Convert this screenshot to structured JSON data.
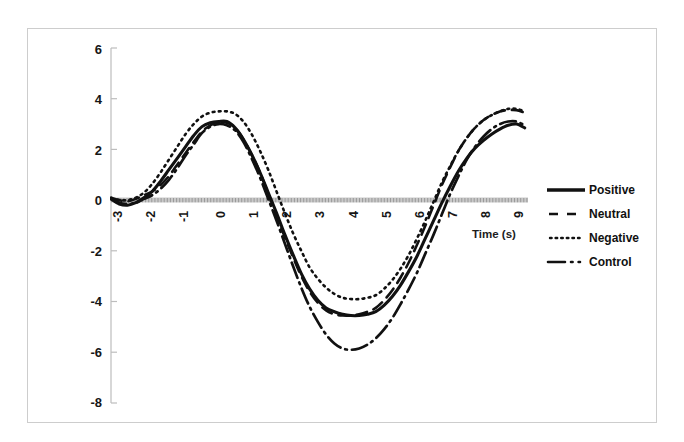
{
  "chart_data": {
    "type": "line",
    "title": "",
    "xlabel": "Time (s)",
    "ylabel": "Change in heart rate (beats/mn)",
    "xlim": [
      -3,
      9.6
    ],
    "ylim": [
      -8,
      6
    ],
    "xticks": [
      "-3",
      "-2",
      "-1",
      "0",
      "1",
      "2",
      "3",
      "4",
      "5",
      "6",
      "7",
      "8",
      "9"
    ],
    "yticks": [
      "6",
      "4",
      "2",
      "0",
      "-2",
      "-4",
      "-6",
      "-8"
    ],
    "grid": false,
    "legend_position": "right",
    "x": [
      -3,
      -2.75,
      -2.5,
      -2.25,
      -2,
      -1.75,
      -1.5,
      -1.25,
      -1,
      -0.75,
      -0.5,
      -0.25,
      0,
      0.25,
      0.5,
      0.75,
      1,
      1.25,
      1.5,
      1.75,
      2,
      2.25,
      2.5,
      2.75,
      3,
      3.25,
      3.5,
      3.75,
      4,
      4.25,
      4.5,
      4.75,
      5,
      5.25,
      5.5,
      5.75,
      6,
      6.25,
      6.5,
      6.75,
      7,
      7.25,
      7.5,
      7.75,
      8,
      8.25,
      8.5,
      8.75,
      9,
      9.25,
      9.5
    ],
    "series": [
      {
        "name": "Positive",
        "style": "solid",
        "color": "#111111",
        "values": [
          0.05,
          -0.15,
          -0.2,
          -0.1,
          0.1,
          0.35,
          0.75,
          1.2,
          1.65,
          2.1,
          2.55,
          2.9,
          3.05,
          3.1,
          3.1,
          2.85,
          2.4,
          1.8,
          1.1,
          0.3,
          -0.5,
          -1.35,
          -2.15,
          -2.9,
          -3.5,
          -3.95,
          -4.25,
          -4.4,
          -4.5,
          -4.55,
          -4.55,
          -4.5,
          -4.4,
          -4.15,
          -3.8,
          -3.35,
          -2.8,
          -2.2,
          -1.5,
          -0.8,
          -0.1,
          0.55,
          1.15,
          1.65,
          2.05,
          2.35,
          2.6,
          2.8,
          2.95,
          3.0,
          2.85
        ]
      },
      {
        "name": "Neutral",
        "style": "dashed",
        "color": "#111111",
        "values": [
          0.1,
          0.0,
          -0.05,
          0.05,
          0.2,
          0.35,
          0.6,
          0.95,
          1.4,
          1.85,
          2.3,
          2.7,
          2.95,
          3.05,
          3.05,
          2.85,
          2.4,
          1.8,
          1.1,
          0.25,
          -0.6,
          -1.45,
          -2.25,
          -3.0,
          -3.6,
          -4.05,
          -4.35,
          -4.5,
          -4.55,
          -4.55,
          -4.5,
          -4.4,
          -4.25,
          -3.95,
          -3.55,
          -3.05,
          -2.45,
          -1.75,
          -1.0,
          -0.2,
          0.6,
          1.3,
          1.95,
          2.45,
          2.85,
          3.15,
          3.35,
          3.5,
          3.55,
          3.55,
          3.45
        ]
      },
      {
        "name": "Negative",
        "style": "dotted",
        "color": "#111111",
        "values": [
          0.05,
          0.0,
          0.0,
          0.1,
          0.3,
          0.65,
          1.1,
          1.6,
          2.1,
          2.6,
          3.0,
          3.3,
          3.45,
          3.5,
          3.5,
          3.4,
          3.1,
          2.6,
          1.95,
          1.2,
          0.35,
          -0.5,
          -1.3,
          -2.0,
          -2.65,
          -3.1,
          -3.45,
          -3.7,
          -3.85,
          -3.9,
          -3.9,
          -3.85,
          -3.75,
          -3.5,
          -3.15,
          -2.7,
          -2.15,
          -1.5,
          -0.8,
          -0.05,
          0.7,
          1.35,
          1.95,
          2.45,
          2.85,
          3.15,
          3.35,
          3.5,
          3.6,
          3.6,
          3.5
        ]
      },
      {
        "name": "Control",
        "style": "dashdot",
        "color": "#111111",
        "values": [
          0.05,
          -0.1,
          -0.15,
          -0.1,
          0.05,
          0.2,
          0.45,
          0.8,
          1.25,
          1.75,
          2.2,
          2.65,
          2.9,
          3.0,
          2.95,
          2.75,
          2.3,
          1.65,
          0.9,
          0.05,
          -0.8,
          -1.7,
          -2.6,
          -3.45,
          -4.2,
          -4.8,
          -5.3,
          -5.65,
          -5.85,
          -5.9,
          -5.85,
          -5.7,
          -5.45,
          -5.1,
          -4.65,
          -4.1,
          -3.5,
          -2.85,
          -2.1,
          -1.35,
          -0.55,
          0.25,
          0.95,
          1.6,
          2.1,
          2.5,
          2.8,
          3.0,
          3.1,
          3.1,
          2.95
        ]
      }
    ],
    "legend": [
      {
        "label": "Positive",
        "style": "solid"
      },
      {
        "label": "Neutral",
        "style": "dashed"
      },
      {
        "label": "Negative",
        "style": "dotted"
      },
      {
        "label": "Control",
        "style": "dashdot"
      }
    ]
  }
}
